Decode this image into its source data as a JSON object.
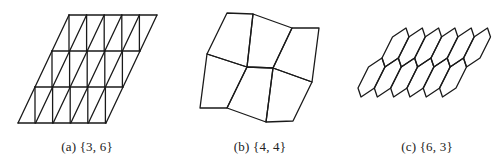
{
  "figure": {
    "panels": [
      {
        "id": "a",
        "caption": "(a) {3, 6}",
        "caption_x": 87,
        "tiling": "triangular",
        "schlafli": "{3, 6}",
        "grid": {
          "rows": 3,
          "cols": 5,
          "top_left": [
            69,
            15
          ],
          "row_height": 36,
          "row_shift": -17,
          "cell_width": 17.6
        }
      },
      {
        "id": "b",
        "caption": "(b) {4, 4}",
        "caption_x": 260,
        "tiling": "quadrilateral",
        "schlafli": "{4, 4}",
        "vertices": [
          [
            227,
            13
          ],
          [
            253,
            14
          ],
          [
            292,
            28
          ],
          [
            319,
            28
          ],
          [
            207,
            54
          ],
          [
            247,
            67
          ],
          [
            273,
            68
          ],
          [
            312,
            82
          ],
          [
            200,
            108
          ],
          [
            227,
            108
          ],
          [
            266,
            122
          ],
          [
            293,
            121
          ]
        ],
        "faces": [
          [
            0,
            1,
            5,
            4
          ],
          [
            1,
            2,
            6,
            5
          ],
          [
            2,
            3,
            7,
            6
          ],
          [
            4,
            5,
            9,
            8
          ],
          [
            5,
            6,
            10,
            9
          ],
          [
            6,
            7,
            11,
            10
          ]
        ]
      },
      {
        "id": "c",
        "caption": "(c) {6, 3}",
        "caption_x": 427,
        "tiling": "hexagonal",
        "schlafli": "{6, 3}",
        "grid": {
          "rows": 2,
          "cols": 6,
          "first_top": [
            406,
            28
          ],
          "period": [
            16.3,
            0
          ],
          "shape": [
            [
              0,
              0
            ],
            [
              3,
              9
            ],
            [
              -7.5,
              30
            ],
            [
              -21,
              39
            ],
            [
              -24,
              30
            ],
            [
              -13.5,
              9
            ]
          ]
        }
      }
    ],
    "stroke_color": "#1a1a1a",
    "text_color": "#222222"
  }
}
